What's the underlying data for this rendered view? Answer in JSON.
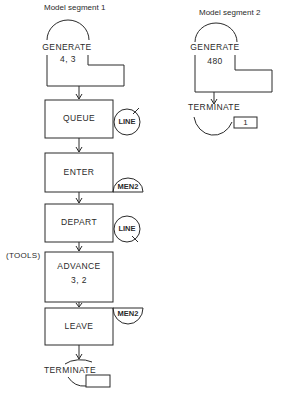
{
  "segments": [
    {
      "title": "Model segment 1",
      "blocks": [
        {
          "type": "GENERATE",
          "label": "GENERATE",
          "operand": "4, 3"
        },
        {
          "type": "QUEUE",
          "label": "QUEUE",
          "resource": "LINE"
        },
        {
          "type": "ENTER",
          "label": "ENTER",
          "resource": "MEN2"
        },
        {
          "type": "DEPART",
          "label": "DEPART",
          "resource": "LINE"
        },
        {
          "type": "ADVANCE",
          "label": "ADVANCE",
          "operand": "3, 2",
          "location_label": "(TOOLS)"
        },
        {
          "type": "LEAVE",
          "label": "LEAVE",
          "resource": "MEN2"
        },
        {
          "type": "TERMINATE",
          "label": "TERMINATE",
          "operand": ""
        }
      ]
    },
    {
      "title": "Model segment 2",
      "blocks": [
        {
          "type": "GENERATE",
          "label": "GENERATE",
          "operand": "480"
        },
        {
          "type": "TERMINATE",
          "label": "TERMINATE",
          "operand": "1"
        }
      ]
    }
  ],
  "colors": {
    "ink": "#2a2a2a",
    "background": "#ffffff"
  }
}
